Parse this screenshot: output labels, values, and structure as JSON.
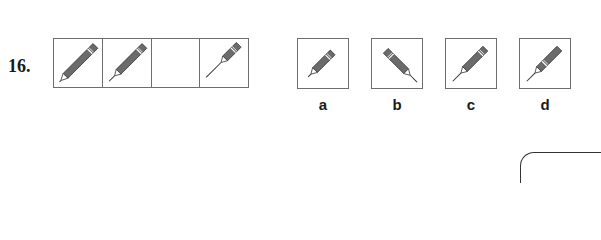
{
  "question": {
    "number": "16.",
    "sequence_cells": [
      {
        "icon": "pencil-icon",
        "variant": "long-body-short-lead",
        "empty": false
      },
      {
        "icon": "pencil-icon",
        "variant": "medium-body-medium-lead",
        "empty": false
      },
      {
        "icon": null,
        "variant": "blank",
        "empty": true
      },
      {
        "icon": "pencil-icon",
        "variant": "short-body-long-lead",
        "empty": false
      }
    ],
    "options": [
      {
        "label": "a",
        "icon": "pencil-icon",
        "variant": "short-body-short-lead"
      },
      {
        "label": "b",
        "icon": "pencil-icon",
        "variant": "flipped-medium-lead"
      },
      {
        "label": "c",
        "icon": "pencil-icon",
        "variant": "medium-body-long-lead"
      },
      {
        "label": "d",
        "icon": "pencil-icon",
        "variant": "medium-body-long-lead-band-shifted"
      }
    ]
  },
  "colors": {
    "pencil_body": "#6b6b6b",
    "pencil_outline": "#333333",
    "border": "#6e6e6e",
    "text": "#1a1a1a"
  }
}
